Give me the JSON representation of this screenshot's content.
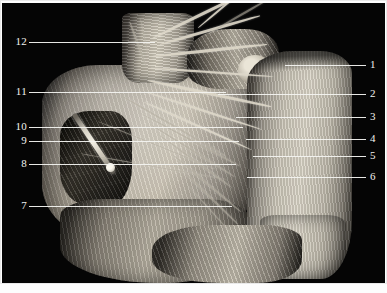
{
  "figure": {
    "kind": "anatomical-dissection-photograph",
    "background_color": "#050505",
    "border_color": "#e9e9e9",
    "leader_line_color": "#f3f3f0",
    "label_text_color": "#f2f2ef"
  },
  "labels": {
    "right": [
      {
        "number": "1",
        "y": 65,
        "line_from_x": 285,
        "line_to_x": 366
      },
      {
        "number": "2",
        "y": 94,
        "line_from_x": 218,
        "line_to_x": 366
      },
      {
        "number": "3",
        "y": 117,
        "line_from_x": 236,
        "line_to_x": 366
      },
      {
        "number": "4",
        "y": 139,
        "line_from_x": 246,
        "line_to_x": 366
      },
      {
        "number": "5",
        "y": 156,
        "line_from_x": 253,
        "line_to_x": 366
      },
      {
        "number": "6",
        "y": 177,
        "line_from_x": 247,
        "line_to_x": 366
      }
    ],
    "left": [
      {
        "number": "12",
        "y": 42,
        "line_from_x": 29,
        "line_to_x": 155
      },
      {
        "number": "11",
        "y": 92,
        "line_from_x": 29,
        "line_to_x": 226
      },
      {
        "number": "10",
        "y": 127,
        "line_from_x": 29,
        "line_to_x": 243
      },
      {
        "number": "9",
        "y": 141,
        "line_from_x": 29,
        "line_to_x": 239
      },
      {
        "number": "8",
        "y": 164,
        "line_from_x": 29,
        "line_to_x": 236
      },
      {
        "number": "7",
        "y": 206,
        "line_from_x": 29,
        "line_to_x": 232
      }
    ]
  }
}
